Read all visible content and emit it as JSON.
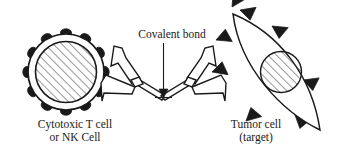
{
  "figure": {
    "background_color": "#ffffff",
    "stroke_color": "#1a1a1a",
    "fill_color": "#ffffff",
    "hatch_color": "#555555"
  },
  "labels": {
    "effector_cell": {
      "line1": "Cytotoxic T cell",
      "line2": "or NK Cell"
    },
    "target_cell": {
      "line1": "Tumor cell",
      "line2": "(target)"
    },
    "linker": {
      "text": "Covalent bond"
    }
  },
  "elements": {
    "effector_cell": {
      "name": "cytotoxic-t-cell",
      "shape": "circle-with-membrane-ring",
      "center": [
        66,
        72
      ],
      "outer_radius": 38,
      "inner_radius": 31,
      "receptor_count": 12,
      "receptor_shape": "dark-rounded-lobe",
      "nucleus_fill": "diagonal-hatch"
    },
    "target_cell": {
      "name": "tumor-cell",
      "shape": "lens-biconvex",
      "tip_top": [
        233,
        14
      ],
      "tip_bottom": [
        320,
        130
      ],
      "antigen_count": 8,
      "antigen_shape": "dark-triangle",
      "nucleus": {
        "center": [
          281,
          72
        ],
        "radius": 21,
        "fill": "diagonal-hatch"
      }
    },
    "antibodies": [
      {
        "name": "antibody-left",
        "orientation": "arms-toward-t-cell",
        "binds_to": "cytotoxic-t-cell"
      },
      {
        "name": "antibody-right",
        "orientation": "arms-toward-tumor-cell",
        "binds_to": "tumor-cell"
      }
    ],
    "linker": {
      "name": "covalent-bond-junction",
      "position": [
        163,
        98
      ],
      "pointer": "vertical-leader-with-arrowhead"
    }
  }
}
